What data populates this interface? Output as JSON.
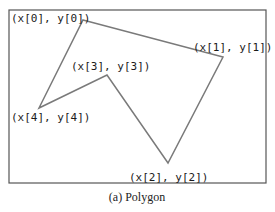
{
  "figure": {
    "caption": "(a) Polygon",
    "frame": {
      "x": 9,
      "y": 10,
      "width": 257,
      "height": 173,
      "stroke": "#555555"
    },
    "polygon": {
      "stroke": "#7a7a7a",
      "vertices": [
        {
          "id": 0,
          "x": 83,
          "y": 20,
          "label": "(x[0], y[0])"
        },
        {
          "id": 1,
          "x": 223,
          "y": 57,
          "label": "(x[1], y[1])"
        },
        {
          "id": 2,
          "x": 168,
          "y": 163,
          "label": "(x[2], y[2])"
        },
        {
          "id": 3,
          "x": 107,
          "y": 75,
          "label": "(x[3], y[3])"
        },
        {
          "id": 4,
          "x": 39,
          "y": 108,
          "label": "(x[4], y[4])"
        }
      ]
    }
  }
}
